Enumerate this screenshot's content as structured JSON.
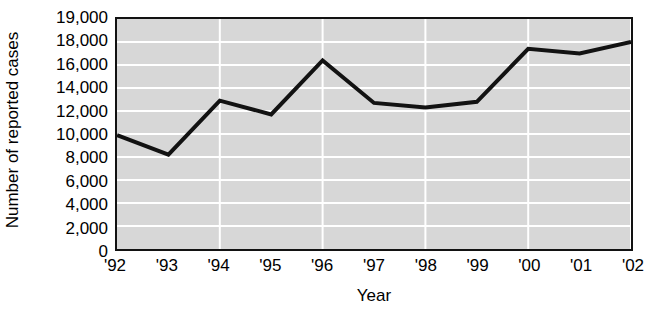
{
  "chart_data": {
    "type": "line",
    "title": "",
    "subtitle": "",
    "xlabel": "Year",
    "ylabel": "Number of reported cases",
    "categories": [
      "'92",
      "'93",
      "'94",
      "'95",
      "'96",
      "'97",
      "'98",
      "'99",
      "'00",
      "'01",
      "'02"
    ],
    "values": [
      9900,
      8200,
      12900,
      11700,
      16400,
      12700,
      12300,
      12800,
      17400,
      17000,
      18000
    ],
    "series": [
      {
        "name": "Number of reported cases",
        "values": [
          9900,
          8200,
          12900,
          11700,
          16400,
          12700,
          12300,
          12800,
          17400,
          17000,
          18000
        ]
      }
    ],
    "ytick_labels": [
      "19,000",
      "18,000",
      "16,000",
      "14,000",
      "12,000",
      "10,000",
      "8,000",
      "6,000",
      "4,000",
      "2,000",
      "0"
    ],
    "ytick_values": [
      19000,
      18000,
      16000,
      14000,
      12000,
      10000,
      8000,
      6000,
      4000,
      2000,
      0
    ],
    "ylim": [
      0,
      19000
    ],
    "xlim": [
      "'92",
      "'02"
    ],
    "grid": "horizontal-and-vertical",
    "grid_color": "#ffffff",
    "plot_background": "#d7d7d7",
    "line_color": "#121212",
    "axis_color": "#121212",
    "legend": "none",
    "legend_position": "none",
    "markers": "none",
    "vertical_gridline_categories": [
      "'94",
      "'96",
      "'98",
      "'00",
      "'02"
    ]
  }
}
